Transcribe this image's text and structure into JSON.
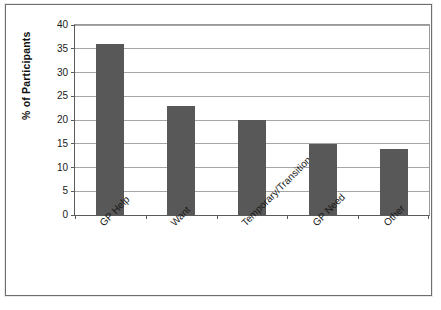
{
  "chart_data": {
    "type": "bar",
    "title": "",
    "subtitle": "",
    "xlabel": "",
    "ylabel": "% of Participants",
    "categories": [
      "GP Help",
      "Want",
      "Temporary/Transition",
      "GP Need",
      "Other"
    ],
    "values": [
      36,
      23,
      20,
      15,
      14
    ],
    "series": [
      {
        "name": "% of Participants",
        "values": [
          36,
          23,
          20,
          15,
          14
        ]
      }
    ],
    "ylim": [
      0,
      40
    ],
    "ytick_labels": [
      "0",
      "5",
      "10",
      "15",
      "20",
      "25",
      "30",
      "35",
      "40"
    ],
    "ytick_values": [
      0,
      5,
      10,
      15,
      20,
      25,
      30,
      35,
      40
    ],
    "grid": "horizontal",
    "legend": "none",
    "bar_color": "#585858",
    "gridline_color": "#a6a6a6",
    "axis_color": "#5a5a5a",
    "background_color": "#ffffff",
    "xtick_label_rotation": -45
  }
}
